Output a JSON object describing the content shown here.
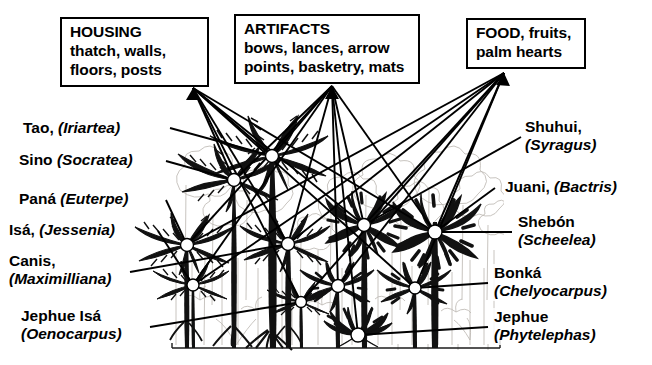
{
  "figure": {
    "type": "ethnobotany-forest-profile-diagram"
  },
  "categories": [
    {
      "id": "housing",
      "lines": [
        "HOUSING",
        "thatch, walls,",
        "floors, posts"
      ],
      "apex": {
        "x": 193,
        "y": 88
      }
    },
    {
      "id": "artifacts",
      "lines": [
        "ARTIFACTS",
        "bows, lances, arrow",
        "points, basketry, mats"
      ],
      "apex": {
        "x": 332,
        "y": 86
      }
    },
    {
      "id": "food",
      "lines": [
        "FOOD, fruits,",
        "palm hearts"
      ],
      "apex": {
        "x": 504,
        "y": 73
      }
    }
  ],
  "species_left": [
    {
      "id": "tao",
      "common": "Tao, ",
      "genus": "(Iriartea)",
      "anchor": {
        "x": 170,
        "y": 128
      }
    },
    {
      "id": "sino",
      "common": "Sino ",
      "genus": "(Socratea)",
      "anchor": {
        "x": 166,
        "y": 161
      }
    },
    {
      "id": "pana",
      "common": "Paná ",
      "genus": "(Euterpe)",
      "anchor": {
        "x": 166,
        "y": 200
      }
    },
    {
      "id": "isa",
      "common": "Isá, ",
      "genus": "(Jessenia)",
      "anchor": {
        "x": 158,
        "y": 231
      }
    },
    {
      "id": "canis",
      "common": "Canis,",
      "genus": "(Maximilliana)",
      "anchor": {
        "x": 130,
        "y": 272
      },
      "two_line": true
    },
    {
      "id": "jephue-isa",
      "common": "Jephue Isá",
      "genus": "(Oenocarpus)",
      "anchor": {
        "x": 150,
        "y": 327
      },
      "two_line": true
    }
  ],
  "species_right": [
    {
      "id": "shuhui",
      "common": "Shuhui,",
      "genus": "(Syragus)",
      "anchor": {
        "x": 521,
        "y": 137
      },
      "two_line": true
    },
    {
      "id": "juani",
      "common": "Juani, ",
      "genus": "(Bactris)",
      "anchor": {
        "x": 495,
        "y": 188
      }
    },
    {
      "id": "shebon",
      "common": "Shebón",
      "genus": "(Scheelea)",
      "anchor": {
        "x": 512,
        "y": 232
      },
      "two_line": true
    },
    {
      "id": "bonka",
      "common": "Bonká",
      "genus": "(Chelyocarpus)",
      "anchor": {
        "x": 488,
        "y": 283
      },
      "two_line": true
    },
    {
      "id": "jephue",
      "common": "Jephue",
      "genus": "(Phytelephas)",
      "anchor": {
        "x": 488,
        "y": 327
      },
      "two_line": true
    }
  ],
  "colors": {
    "ink": "#000000",
    "paper": "#ffffff",
    "background_trees": "#b9b4ae",
    "node_fill": "#ffffff"
  },
  "nodes": [
    {
      "id": "n-tao",
      "x": 272,
      "y": 156,
      "r": 6.5
    },
    {
      "id": "n-sino",
      "x": 234,
      "y": 180,
      "r": 6.5
    },
    {
      "id": "n-pana",
      "x": 187,
      "y": 245,
      "r": 6.5
    },
    {
      "id": "n-isa",
      "x": 193,
      "y": 285,
      "r": 6.0
    },
    {
      "id": "n-canis",
      "x": 288,
      "y": 244,
      "r": 6.5
    },
    {
      "id": "n-jephueisa",
      "x": 301,
      "y": 302,
      "r": 5.5
    },
    {
      "id": "n-shuhui",
      "x": 364,
      "y": 225,
      "r": 6.5
    },
    {
      "id": "n-juani",
      "x": 338,
      "y": 286,
      "r": 6.5
    },
    {
      "id": "n-shebon",
      "x": 435,
      "y": 232,
      "r": 7.0
    },
    {
      "id": "n-bonka",
      "x": 415,
      "y": 288,
      "r": 6.0
    },
    {
      "id": "n-jephue",
      "x": 358,
      "y": 335,
      "r": 7.0
    }
  ],
  "groundline": {
    "x1": 172,
    "x2": 500,
    "y": 348
  }
}
